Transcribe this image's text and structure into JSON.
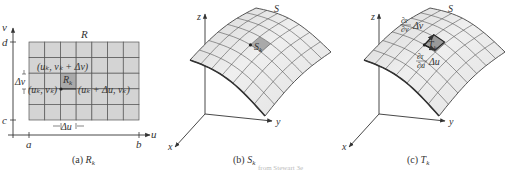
{
  "colors": {
    "cell_fill": "#d4d4d4",
    "highlight_fill": "#a9a9a9",
    "grid_line": "#555555",
    "surface_light": "#ececec",
    "surface_dark": "#c8c8c8",
    "axis": "#333333"
  },
  "panel_a": {
    "caption_prefix": "(a)",
    "caption_var": "R",
    "caption_sub": "k",
    "region_label": "R",
    "axis_u": "u",
    "axis_v": "v",
    "tick_a": "a",
    "tick_b": "b",
    "tick_c": "c",
    "tick_d": "d",
    "cell_label": "R",
    "cell_label_sub": "k",
    "point_uk_vk": "(u",
    "point_top": "(uₖ, vₖ + Δv)",
    "point_left": "(uₖ, vₖ)",
    "point_right": "(uₖ + Δu, vₖ)",
    "delta_u": "Δu",
    "delta_v": "Δv",
    "grid_cols": 7,
    "grid_rows": 5,
    "highlight_col": 2,
    "highlight_row": 2
  },
  "panel_b": {
    "caption_prefix": "(b)",
    "caption_var": "S",
    "caption_sub": "k",
    "surface_label": "S",
    "patch_label": "S",
    "patch_label_sub": "k",
    "axis_x": "x",
    "axis_y": "y",
    "axis_z": "z"
  },
  "panel_c": {
    "caption_prefix": "(c)",
    "caption_var": "T",
    "caption_sub": "k",
    "surface_label": "S",
    "patch_label": "T",
    "patch_label_sub": "k",
    "partial_v_num": "∂r",
    "partial_v_den": "∂v",
    "partial_v_mult": "Δv",
    "partial_u_num": "∂r",
    "partial_u_den": "∂u",
    "partial_u_mult": "Δu",
    "axis_x": "x",
    "axis_y": "y",
    "axis_z": "z"
  },
  "footer_faint": "from Stewart 3e"
}
